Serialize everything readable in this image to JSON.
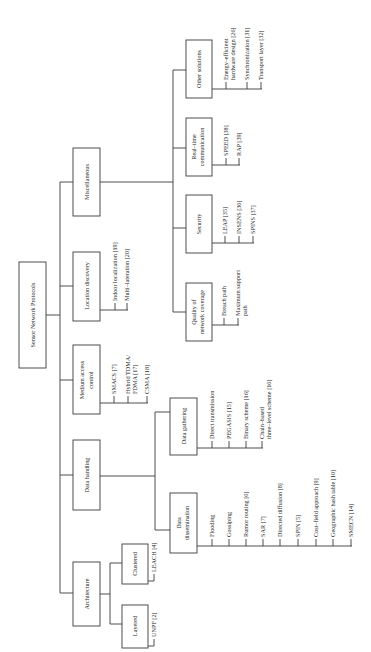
{
  "diagram": {
    "orientation": "rotated-90-ccw",
    "root": "Sensor Network Protocols",
    "categories": [
      {
        "label": "Architecture",
        "children": [
          {
            "label": "Layered",
            "items": [
              "UNPF [2]"
            ]
          },
          {
            "label": "Clustered",
            "items": [
              "LEACH [4]"
            ]
          }
        ]
      },
      {
        "label": "Data handling",
        "children": [
          {
            "label": "Data dissemination",
            "label_lines": [
              "Data",
              "dissemination"
            ],
            "items": [
              "Flooding",
              "Gossiping",
              "Rumor routing [6]",
              "SAR [7]",
              "Directed diffusion [8]",
              "SPIN [5]",
              "Cost–field approach [9]",
              "Geographic hash table [10]",
              "SMECN [14]"
            ]
          },
          {
            "label": "Data gathering",
            "items": [
              "Direct transmission",
              "PEGASIS [15]",
              "Binary scheme [16]",
              "Chain–based three–level scheme [16]"
            ],
            "item_lines": [
              [
                "Direct transmission"
              ],
              [
                "PEGASIS [15]"
              ],
              [
                "Binary scheme [16]"
              ],
              [
                "Chain–based",
                "three–level scheme [16]"
              ]
            ]
          }
        ]
      },
      {
        "label": "Medium access control",
        "label_lines": [
          "Medium access",
          "control"
        ],
        "items": [
          "SMACS [7]",
          "Hybrid TDMA/FDMA [17]",
          "CSMA [18]"
        ],
        "item_lines": [
          [
            "SMACS [7]"
          ],
          [
            "Hybrid TDMA/",
            "FDMA [17]"
          ],
          [
            "CSMA [18]"
          ]
        ]
      },
      {
        "label": "Location discovery",
        "items": [
          "Indoor localization [19]",
          "Multi–lateration [20]"
        ]
      },
      {
        "label": "Miscellaneous",
        "children": [
          {
            "label": "Quality of network coverage",
            "label_lines": [
              "Quality of",
              "network coverage"
            ],
            "items": [
              "Breach path",
              "Maximum support path"
            ],
            "item_lines": [
              [
                "Breach path"
              ],
              [
                "Maximum support",
                "path"
              ]
            ]
          },
          {
            "label": "Security",
            "items": [
              "LEAP [35]",
              "INSENS [36]",
              "SPINS [37]"
            ]
          },
          {
            "label": "Real–time communication",
            "label_lines": [
              "Real–time",
              "communication"
            ],
            "items": [
              "SPEED [38]",
              "RAP [39]"
            ]
          },
          {
            "label": "Other solutions",
            "items": [
              "Energy–efficient hardware design [26]",
              "Synchronization [31]",
              "Transport layer [32]"
            ],
            "item_lines": [
              [
                "Energy–efficient",
                "hardware design [26]"
              ],
              [
                "Synchronization [31]"
              ],
              [
                "Transport layer [32]"
              ]
            ]
          }
        ]
      }
    ]
  },
  "labels": {
    "root": "Sensor Network Protocols",
    "architecture": "Architecture",
    "layered": "Layered",
    "clustered": "Clustered",
    "unpf": "UNPF [2]",
    "leach": "LEACH [4]",
    "data_handling": "Data handling",
    "data_dissem_1": "Data",
    "data_dissem_2": "dissemination",
    "flooding": "Flooding",
    "gossiping": "Gossiping",
    "rumor": "Rumor routing [6]",
    "sar": "SAR [7]",
    "directed": "Directed diffusion [8]",
    "spin": "SPIN [5]",
    "costfield": "Cost–field approach [9]",
    "ght": "Geographic hash table [10]",
    "smecn": "SMECN [14]",
    "data_gathering": "Data gathering",
    "direct": "Direct transmission",
    "pegasis": "PEGASIS [15]",
    "binary": "Binary scheme [16]",
    "chain_1": "Chain–based",
    "chain_2": "three–level scheme [16]",
    "mac_1": "Medium access",
    "mac_2": "control",
    "smacs": "SMACS [7]",
    "hybrid_1": "Hybrid TDMA/",
    "hybrid_2": "FDMA [17]",
    "csma": "CSMA [18]",
    "location": "Location discovery",
    "indoor": "Indoor localization [19]",
    "multilat": "Multi–lateration [20]",
    "misc": "Miscellaneous",
    "qos_1": "Quality of",
    "qos_2": "network coverage",
    "breach": "Breach path",
    "maxsup_1": "Maximum support",
    "maxsup_2": "path",
    "security": "Security",
    "leap": "LEAP [35]",
    "insens": "INSENS [36]",
    "spins": "SPINS [37]",
    "rt_1": "Real–time",
    "rt_2": "communication",
    "speed": "SPEED [38]",
    "rap": "RAP [39]",
    "other": "Other solutions",
    "energy_1": "Energy–efficient",
    "energy_2": "hardware design [26]",
    "sync": "Synchronization [31]",
    "transport": "Transport layer [32]"
  }
}
